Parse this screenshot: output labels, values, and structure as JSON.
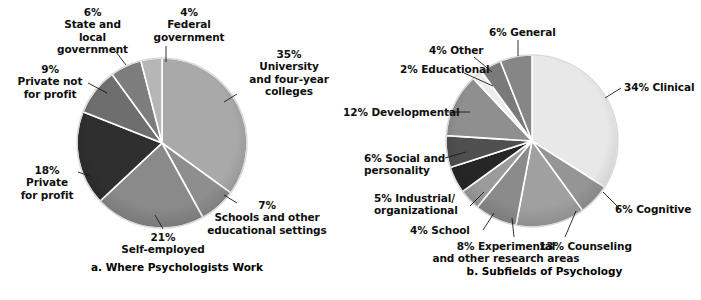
{
  "figure": {
    "background": "#ffffff",
    "leader_line_color": "#1a1a1a",
    "slice_border_color": "#ffffff"
  },
  "chart_data": [
    {
      "type": "pie",
      "id": "where-psychologists-work",
      "title": "a. Where Psychologists Work",
      "center": {
        "x": 162,
        "y": 143
      },
      "radius": 85,
      "start_angle_deg": -90,
      "direction": "clockwise",
      "legend": "labels-outside-with-leader-lines",
      "categories": [
        "University and four-year colleges",
        "Schools and other educational settings",
        "Self-employed",
        "Private for profit",
        "Private not for profit",
        "State and local government",
        "Federal government"
      ],
      "values": [
        35,
        7,
        21,
        18,
        9,
        6,
        4
      ],
      "colors": [
        "#a9a9a9",
        "#8e8e8e",
        "#8a8a8a",
        "#2f2f2f",
        "#6e6e6e",
        "#7d7d7d",
        "#b6b6b6"
      ],
      "labels": [
        {
          "percent": "35%",
          "name": "University\nand four-year\ncolleges"
        },
        {
          "percent": "7%",
          "name": "Schools and other\neducational settings"
        },
        {
          "percent": "21%",
          "name": "Self-employed"
        },
        {
          "percent": "18%",
          "name": "Private\nfor profit"
        },
        {
          "percent": "9%",
          "name": "Private not\nfor profit"
        },
        {
          "percent": "6%",
          "name": "State and\nlocal\ngovernment"
        },
        {
          "percent": "4%",
          "name": "Federal\ngovernment"
        }
      ]
    },
    {
      "type": "pie",
      "id": "subfields-of-psychology",
      "title": "b. Subfields of Psychology",
      "center": {
        "x": 532,
        "y": 141
      },
      "radius": 86,
      "start_angle_deg": -90,
      "direction": "clockwise",
      "legend": "labels-outside-with-leader-lines",
      "categories": [
        "Clinical",
        "Cognitive",
        "Counseling",
        "Experimental and other research areas",
        "School",
        "Industrial/organizational",
        "Social and personality",
        "Developmental",
        "Educational",
        "Other",
        "General"
      ],
      "values": [
        34,
        6,
        13,
        8,
        4,
        5,
        6,
        12,
        2,
        4,
        6
      ],
      "colors": [
        "#e8e8e8",
        "#959595",
        "#a0a0a0",
        "#8b8b8b",
        "#9b9b9b",
        "#262626",
        "#4f4f4f",
        "#8f8f8f",
        "#ededed",
        "#7a7a7a",
        "#868686"
      ],
      "labels": [
        {
          "percent": "34%",
          "name": "Clinical"
        },
        {
          "percent": "6%",
          "name": "Cognitive"
        },
        {
          "percent": "13%",
          "name": "Counseling"
        },
        {
          "percent": "8%",
          "name": "Experimental\nand other research areas"
        },
        {
          "percent": "4%",
          "name": "School"
        },
        {
          "percent": "5%",
          "name": "Industrial/\norganizational"
        },
        {
          "percent": "6%",
          "name": "Social and\npersonality"
        },
        {
          "percent": "12%",
          "name": "Developmental"
        },
        {
          "percent": "2%",
          "name": "Educational"
        },
        {
          "percent": "4%",
          "name": "Other"
        },
        {
          "percent": "6%",
          "name": "General"
        }
      ]
    }
  ],
  "left_chart": {
    "caption": "a. Where Psychologists Work",
    "labels": {
      "state_local": "6%\nState and\nlocal\ngovernment",
      "federal": "4%\nFederal\ngovernment",
      "private_not_for_profit": "9%\nPrivate not\nfor profit",
      "private_for_profit": "18%\nPrivate\nfor profit",
      "self_employed": "21%\nSelf-employed",
      "schools": "7%\nSchools and other\neducational settings",
      "university": "35%\nUniversity\nand four-year\ncolleges"
    }
  },
  "right_chart": {
    "caption": "b. Subfields of Psychology",
    "labels": {
      "general": "6% General",
      "other": "4% Other",
      "educational": "2% Educational",
      "developmental": "12% Developmental",
      "social": "6% Social and\npersonality",
      "industrial": "5% Industrial/\norganizational",
      "school": "4% School",
      "experimental": "8% Experimental\nand other research areas",
      "counseling": "13% Counseling",
      "cognitive": "6% Cognitive",
      "clinical": "34% Clinical"
    }
  }
}
